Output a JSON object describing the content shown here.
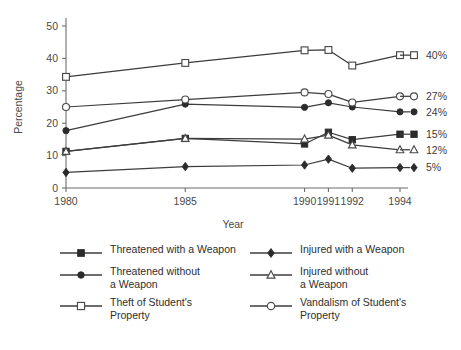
{
  "chart_data": {
    "type": "line",
    "title": "",
    "xlabel": "Year",
    "ylabel": "Percentage",
    "x": [
      1980,
      1985,
      1990,
      1991,
      1992,
      1994
    ],
    "xticklabels": [
      "1980",
      "1985",
      "1990",
      "1991",
      "1992",
      "1994"
    ],
    "yticklabels": [
      "0",
      "10",
      "20",
      "30",
      "40",
      "50"
    ],
    "ylim": [
      0,
      52
    ],
    "xlim": [
      1979,
      1995
    ],
    "grid": false,
    "legend_position": "below-plot-two-columns",
    "series": [
      {
        "name": "Threatened with a Weapon",
        "marker": "filled-square",
        "values": [
          11.3,
          15.3,
          13.6,
          17.2,
          14.9,
          16.6
        ],
        "end_label": "15%"
      },
      {
        "name": "Threatened without a Weapon",
        "marker": "filled-circle",
        "values": [
          17.7,
          25.9,
          24.9,
          26.3,
          25.0,
          23.5
        ],
        "end_label": "24%"
      },
      {
        "name": "Theft of Student's Property",
        "marker": "open-square",
        "values": [
          34.3,
          38.6,
          42.5,
          42.6,
          37.8,
          41.0
        ],
        "end_label": "40%"
      },
      {
        "name": "Injured with a Weapon",
        "marker": "filled-diamond",
        "values": [
          4.8,
          6.6,
          7.1,
          8.9,
          6.1,
          6.3
        ],
        "end_label": "5%"
      },
      {
        "name": "Injured without a Weapon",
        "marker": "open-triangle",
        "values": [
          11.3,
          15.3,
          15.1,
          16.3,
          13.3,
          11.8
        ],
        "end_label": "12%"
      },
      {
        "name": "Vandalism of Student's Property",
        "marker": "open-circle",
        "values": [
          25.0,
          27.3,
          29.5,
          29.0,
          26.4,
          28.3
        ],
        "end_label": "27%"
      }
    ]
  },
  "axes": {
    "ylabel": "Percentage",
    "xlabel": "Year",
    "yticks": [
      "50",
      "40",
      "30",
      "20",
      "10",
      "0"
    ],
    "xticks": [
      "1980",
      "1985",
      "1990",
      "1991",
      "1992",
      "1994"
    ]
  },
  "end_labels": [
    {
      "text": "40%",
      "marker": "open-square"
    },
    {
      "text": "27%",
      "marker": "open-circle"
    },
    {
      "text": "24%",
      "marker": "filled-circle"
    },
    {
      "text": "15%",
      "marker": "filled-square"
    },
    {
      "text": "12%",
      "marker": "open-triangle"
    },
    {
      "text": "5%",
      "marker": "filled-diamond"
    }
  ],
  "legend": {
    "left_column": [
      {
        "label": "Threatened with a Weapon",
        "marker": "filled-square"
      },
      {
        "label": "Threatened without\na Weapon",
        "marker": "filled-circle"
      },
      {
        "label": "Theft of Student's\nProperty",
        "marker": "open-square"
      }
    ],
    "right_column": [
      {
        "label": "Injured with a Weapon",
        "marker": "filled-diamond"
      },
      {
        "label": "Injured without\na Weapon",
        "marker": "open-triangle"
      },
      {
        "label": "Vandalism of Student's\nProperty",
        "marker": "open-circle"
      }
    ]
  },
  "footer": {
    "cut_off_text": ""
  },
  "colors": {
    "line": "#3c3c3c",
    "marker_fill": "#2b2b2b",
    "marker_open": "#ffffff",
    "axis": "#6d6d6d",
    "text": "#2e2e2e",
    "background": "#ffffff"
  }
}
